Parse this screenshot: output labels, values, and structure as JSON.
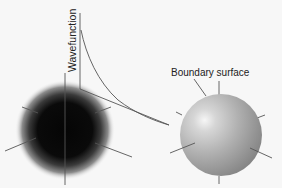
{
  "diagram": {
    "axis_label": "Wavefunction",
    "boundary_label": "Boundary surface",
    "colors": {
      "background": "#f7f7f7",
      "line": "#555555",
      "dark_sphere_core": "#050505",
      "dark_sphere_edge": "#9a9a9a",
      "light_sphere_highlight": "#f4f4f4",
      "light_sphere_mid": "#b8b8b8",
      "light_sphere_shadow": "#8a8a8a"
    },
    "elements": [
      {
        "name": "electron-density-sphere",
        "description": "fuzzy dark sphere showing electron probability density"
      },
      {
        "name": "wavefunction-graph",
        "description": "decaying wavefunction vs radial distance"
      },
      {
        "name": "boundary-surface-sphere",
        "description": "shaded sphere representing the boundary surface"
      }
    ]
  }
}
